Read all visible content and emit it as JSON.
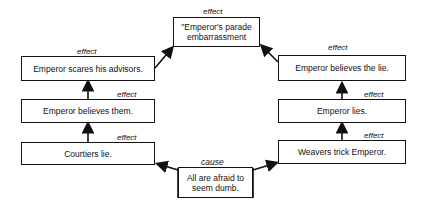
{
  "diagram": {
    "top": {
      "label": "effect",
      "text": "\"Emperor's parade embarrassment"
    },
    "left": [
      {
        "label": "effect",
        "text": "Emperor scares his advisors."
      },
      {
        "label": "effect",
        "text": "Emperor believes them."
      },
      {
        "label": "effect",
        "text": "Courtiers lie."
      }
    ],
    "right": [
      {
        "label": "effect",
        "text": "Emperor believes the lie."
      },
      {
        "label": "effect",
        "text": "Emperor lies."
      },
      {
        "label": "effect",
        "text": "Weavers trick Emperor."
      }
    ],
    "bottom": {
      "label": "cause",
      "text": "All are afraid to seem dumb."
    }
  }
}
